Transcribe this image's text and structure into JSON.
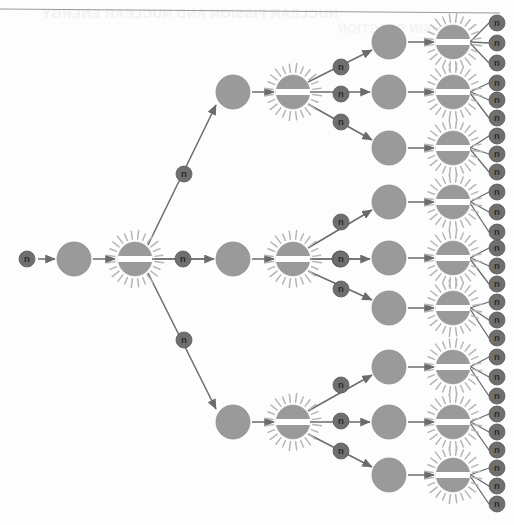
{
  "figure": {
    "type": "nuclear-fission-chain-reaction-diagram",
    "background_color": "#fdfdfd",
    "neutron_label": "n",
    "bleed_through_text_line1": "NUCLEAR FISSION AND NUCLEAR ENERGY",
    "bleed_through_text_line2": "CHAIN REACTION",
    "colors": {
      "neutron_fill": "#6f6f6f",
      "neutron_stroke": "#5a5a5a",
      "neutron_text": "#2b2b2b",
      "nucleus_fill": "#9a9a9a",
      "nucleus_stroke": "#8d8d8d",
      "fission_fill": "#9a9a9a",
      "fission_band": "#ffffff",
      "ray_color": "#b5b5b5",
      "arrow_color": "#6b6b6b",
      "line_color": "#6b6b6b",
      "rule_color": "#9a9a9a"
    },
    "sizes": {
      "neutron_radius": 8,
      "nucleus_radius": 17,
      "fission_radius": 17,
      "fission_band_height": 6,
      "ray_count": 24,
      "ray_inner": 20,
      "ray_outer": 27
    },
    "generations": {
      "gen0_label": "incident neutron",
      "gen1_count": 1,
      "gen2_count": 3,
      "gen3_count": 9,
      "neutrons_per_fission": 3,
      "total_emitted_neutrons": 27
    },
    "top_rule": {
      "x1": 0,
      "y1": 9,
      "x2": 500,
      "y2": 13
    },
    "neutrons": [
      {
        "x": 27,
        "y": 259
      },
      {
        "x": 183,
        "y": 259
      },
      {
        "x": 184,
        "y": 174
      },
      {
        "x": 184,
        "y": 340
      },
      {
        "x": 340,
        "y": 259
      },
      {
        "x": 341,
        "y": 67
      },
      {
        "x": 341,
        "y": 94
      },
      {
        "x": 341,
        "y": 122
      },
      {
        "x": 341,
        "y": 222
      },
      {
        "x": 341,
        "y": 259
      },
      {
        "x": 341,
        "y": 289
      },
      {
        "x": 341,
        "y": 385
      },
      {
        "x": 341,
        "y": 421
      },
      {
        "x": 341,
        "y": 451
      },
      {
        "x": 497,
        "y": 23
      },
      {
        "x": 497,
        "y": 43
      },
      {
        "x": 497,
        "y": 63
      },
      {
        "x": 497,
        "y": 83
      },
      {
        "x": 497,
        "y": 100
      },
      {
        "x": 497,
        "y": 118
      },
      {
        "x": 497,
        "y": 136
      },
      {
        "x": 497,
        "y": 154
      },
      {
        "x": 497,
        "y": 172
      },
      {
        "x": 497,
        "y": 192
      },
      {
        "x": 497,
        "y": 212
      },
      {
        "x": 497,
        "y": 232
      },
      {
        "x": 497,
        "y": 248
      },
      {
        "x": 497,
        "y": 266
      },
      {
        "x": 497,
        "y": 284
      },
      {
        "x": 497,
        "y": 302
      },
      {
        "x": 497,
        "y": 320
      },
      {
        "x": 497,
        "y": 338
      },
      {
        "x": 497,
        "y": 357
      },
      {
        "x": 497,
        "y": 377
      },
      {
        "x": 497,
        "y": 396
      },
      {
        "x": 497,
        "y": 414
      },
      {
        "x": 497,
        "y": 432
      },
      {
        "x": 497,
        "y": 450
      },
      {
        "x": 497,
        "y": 468
      },
      {
        "x": 497,
        "y": 486
      },
      {
        "x": 497,
        "y": 504
      }
    ],
    "nuclei": [
      {
        "x": 74,
        "y": 259,
        "gen": 0
      },
      {
        "x": 233,
        "y": 92,
        "gen": 1
      },
      {
        "x": 233,
        "y": 259,
        "gen": 1
      },
      {
        "x": 233,
        "y": 422,
        "gen": 1
      },
      {
        "x": 389,
        "y": 42,
        "gen": 2
      },
      {
        "x": 389,
        "y": 92,
        "gen": 2
      },
      {
        "x": 389,
        "y": 148,
        "gen": 2
      },
      {
        "x": 389,
        "y": 202,
        "gen": 2
      },
      {
        "x": 389,
        "y": 258,
        "gen": 2
      },
      {
        "x": 389,
        "y": 308,
        "gen": 2
      },
      {
        "x": 389,
        "y": 367,
        "gen": 2
      },
      {
        "x": 389,
        "y": 422,
        "gen": 2
      },
      {
        "x": 389,
        "y": 475,
        "gen": 2
      }
    ],
    "fissions": [
      {
        "x": 135,
        "y": 259,
        "gen": 0
      },
      {
        "x": 293,
        "y": 92,
        "gen": 1
      },
      {
        "x": 293,
        "y": 259,
        "gen": 1
      },
      {
        "x": 293,
        "y": 422,
        "gen": 1
      },
      {
        "x": 453,
        "y": 42,
        "gen": 2
      },
      {
        "x": 453,
        "y": 92,
        "gen": 2
      },
      {
        "x": 453,
        "y": 148,
        "gen": 2
      },
      {
        "x": 453,
        "y": 202,
        "gen": 2
      },
      {
        "x": 453,
        "y": 258,
        "gen": 2
      },
      {
        "x": 453,
        "y": 308,
        "gen": 2
      },
      {
        "x": 453,
        "y": 367,
        "gen": 2
      },
      {
        "x": 453,
        "y": 422,
        "gen": 2
      },
      {
        "x": 453,
        "y": 475,
        "gen": 2
      }
    ],
    "arrows": [
      {
        "x1": 38,
        "y1": 259,
        "x2": 55,
        "y2": 259
      },
      {
        "x1": 93,
        "y1": 259,
        "x2": 115,
        "y2": 259
      },
      {
        "x1": 148,
        "y1": 245,
        "x2": 216,
        "y2": 105
      },
      {
        "x1": 152,
        "y1": 259,
        "x2": 214,
        "y2": 259
      },
      {
        "x1": 148,
        "y1": 273,
        "x2": 216,
        "y2": 409
      },
      {
        "x1": 252,
        "y1": 92,
        "x2": 274,
        "y2": 92
      },
      {
        "x1": 252,
        "y1": 259,
        "x2": 274,
        "y2": 259
      },
      {
        "x1": 252,
        "y1": 422,
        "x2": 274,
        "y2": 422
      },
      {
        "x1": 308,
        "y1": 82,
        "x2": 372,
        "y2": 50
      },
      {
        "x1": 310,
        "y1": 92,
        "x2": 370,
        "y2": 92
      },
      {
        "x1": 308,
        "y1": 104,
        "x2": 372,
        "y2": 140
      },
      {
        "x1": 308,
        "y1": 248,
        "x2": 372,
        "y2": 210
      },
      {
        "x1": 310,
        "y1": 259,
        "x2": 370,
        "y2": 259
      },
      {
        "x1": 308,
        "y1": 271,
        "x2": 372,
        "y2": 300
      },
      {
        "x1": 308,
        "y1": 411,
        "x2": 372,
        "y2": 375
      },
      {
        "x1": 310,
        "y1": 422,
        "x2": 370,
        "y2": 422
      },
      {
        "x1": 308,
        "y1": 434,
        "x2": 372,
        "y2": 467
      },
      {
        "x1": 408,
        "y1": 42,
        "x2": 434,
        "y2": 42
      },
      {
        "x1": 408,
        "y1": 92,
        "x2": 434,
        "y2": 92
      },
      {
        "x1": 408,
        "y1": 148,
        "x2": 434,
        "y2": 148
      },
      {
        "x1": 408,
        "y1": 202,
        "x2": 434,
        "y2": 202
      },
      {
        "x1": 408,
        "y1": 258,
        "x2": 434,
        "y2": 258
      },
      {
        "x1": 408,
        "y1": 308,
        "x2": 434,
        "y2": 308
      },
      {
        "x1": 408,
        "y1": 367,
        "x2": 434,
        "y2": 367
      },
      {
        "x1": 408,
        "y1": 422,
        "x2": 434,
        "y2": 422
      },
      {
        "x1": 408,
        "y1": 475,
        "x2": 434,
        "y2": 475
      }
    ],
    "plain_lines": [
      {
        "x1": 155,
        "y1": 259,
        "x2": 176,
        "y2": 259
      },
      {
        "x1": 190,
        "y1": 259,
        "x2": 214,
        "y2": 259
      },
      {
        "x1": 312,
        "y1": 259,
        "x2": 333,
        "y2": 259
      },
      {
        "x1": 347,
        "y1": 259,
        "x2": 370,
        "y2": 259
      },
      {
        "x1": 470,
        "y1": 42,
        "x2": 489,
        "y2": 23
      },
      {
        "x1": 471,
        "y1": 42,
        "x2": 489,
        "y2": 43
      },
      {
        "x1": 470,
        "y1": 43,
        "x2": 489,
        "y2": 63
      },
      {
        "x1": 470,
        "y1": 92,
        "x2": 489,
        "y2": 83
      },
      {
        "x1": 471,
        "y1": 92,
        "x2": 489,
        "y2": 100
      },
      {
        "x1": 470,
        "y1": 93,
        "x2": 489,
        "y2": 118
      },
      {
        "x1": 470,
        "y1": 148,
        "x2": 489,
        "y2": 136
      },
      {
        "x1": 471,
        "y1": 148,
        "x2": 489,
        "y2": 154
      },
      {
        "x1": 470,
        "y1": 149,
        "x2": 489,
        "y2": 172
      },
      {
        "x1": 470,
        "y1": 202,
        "x2": 489,
        "y2": 192
      },
      {
        "x1": 471,
        "y1": 202,
        "x2": 489,
        "y2": 212
      },
      {
        "x1": 470,
        "y1": 203,
        "x2": 489,
        "y2": 232
      },
      {
        "x1": 470,
        "y1": 258,
        "x2": 489,
        "y2": 248
      },
      {
        "x1": 471,
        "y1": 258,
        "x2": 489,
        "y2": 266
      },
      {
        "x1": 470,
        "y1": 259,
        "x2": 489,
        "y2": 284
      },
      {
        "x1": 470,
        "y1": 308,
        "x2": 489,
        "y2": 302
      },
      {
        "x1": 471,
        "y1": 308,
        "x2": 489,
        "y2": 320
      },
      {
        "x1": 470,
        "y1": 309,
        "x2": 489,
        "y2": 338
      },
      {
        "x1": 470,
        "y1": 367,
        "x2": 489,
        "y2": 357
      },
      {
        "x1": 471,
        "y1": 367,
        "x2": 489,
        "y2": 377
      },
      {
        "x1": 470,
        "y1": 368,
        "x2": 489,
        "y2": 396
      },
      {
        "x1": 470,
        "y1": 422,
        "x2": 489,
        "y2": 414
      },
      {
        "x1": 471,
        "y1": 422,
        "x2": 489,
        "y2": 432
      },
      {
        "x1": 470,
        "y1": 423,
        "x2": 489,
        "y2": 450
      },
      {
        "x1": 470,
        "y1": 475,
        "x2": 489,
        "y2": 468
      },
      {
        "x1": 471,
        "y1": 475,
        "x2": 489,
        "y2": 486
      },
      {
        "x1": 470,
        "y1": 476,
        "x2": 489,
        "y2": 504
      }
    ]
  }
}
